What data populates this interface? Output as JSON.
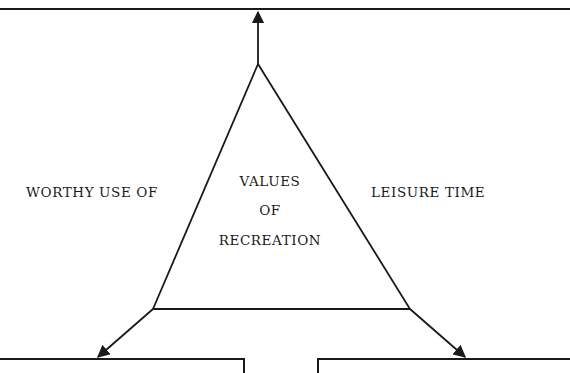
{
  "diagram": {
    "left_label": "WORTHY USE OF",
    "right_label": "LEISURE TIME",
    "center_label": {
      "line1": "VALUES",
      "line2": "OF",
      "line3": "RECREATION"
    },
    "line_color": "#1a1a1a",
    "background": "#ffffff"
  }
}
